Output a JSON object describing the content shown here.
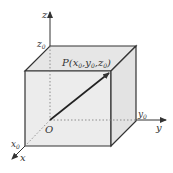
{
  "diagram": {
    "axes": {
      "x": {
        "label": "x",
        "tick": "x",
        "tick_sub": "0"
      },
      "y": {
        "label": "y",
        "tick": "y",
        "tick_sub": "0"
      },
      "z": {
        "label": "z",
        "tick": "z",
        "tick_sub": "0"
      }
    },
    "origin": {
      "label": "O"
    },
    "point": {
      "prefix": "P(",
      "x": "x",
      "xs": "0",
      "sep1": ",",
      "y": "y",
      "ys": "0",
      "sep2": ",",
      "z": "z",
      "zs": "0",
      "suffix": ")"
    },
    "colors": {
      "face": "#e9e9e9",
      "edge": "#333333",
      "dotted": "#777777"
    }
  }
}
